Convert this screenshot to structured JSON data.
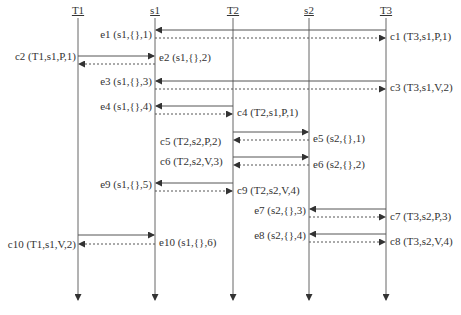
{
  "lifelines": [
    {
      "id": "T1",
      "label": "T1",
      "x": 78
    },
    {
      "id": "s1",
      "label": "s1",
      "x": 155
    },
    {
      "id": "T2",
      "label": "T2",
      "x": 233
    },
    {
      "id": "s2",
      "label": "s2",
      "x": 309
    },
    {
      "id": "T3",
      "label": "T3",
      "x": 386
    }
  ],
  "lifeline_top": 18,
  "lifeline_bottom": 302,
  "messages": [
    {
      "from": "T3",
      "to": "s1",
      "y": 30,
      "style": "solid",
      "label": "c1 (T3,s1,P,1)"
    },
    {
      "from": "s1",
      "to": "T3",
      "y": 38,
      "style": "dotted",
      "label": "e1 (s1,{},1)"
    },
    {
      "from": "T1",
      "to": "s1",
      "y": 56,
      "style": "solid",
      "label": "c2 (T1,s1,P,1)"
    },
    {
      "from": "s1",
      "to": "T1",
      "y": 64,
      "style": "dotted",
      "label": "e2 (s1,{},2)"
    },
    {
      "from": "T3",
      "to": "s1",
      "y": 81,
      "style": "solid",
      "label": "c3 (T3,s1,V,2)"
    },
    {
      "from": "s1",
      "to": "T3",
      "y": 89,
      "style": "dotted",
      "label": "e3 (s1,{},3)"
    },
    {
      "from": "T2",
      "to": "s1",
      "y": 106,
      "style": "solid",
      "label": "c4 (T2,s1,P,1)"
    },
    {
      "from": "s1",
      "to": "T2",
      "y": 114,
      "style": "dotted",
      "label": "e4 (s1,{},4)"
    },
    {
      "from": "T2",
      "to": "s2",
      "y": 132,
      "style": "solid",
      "label": "c5 (T2,s2,P,2)"
    },
    {
      "from": "s2",
      "to": "T2",
      "y": 140,
      "style": "dotted",
      "label": "e5 (s2,{},1)"
    },
    {
      "from": "T2",
      "to": "s2",
      "y": 157,
      "style": "solid",
      "label": "c6 (T2,s2,V,3)"
    },
    {
      "from": "s2",
      "to": "T2",
      "y": 165,
      "style": "dotted",
      "label": "e6 (s2,{},2)"
    },
    {
      "from": "T2",
      "to": "s1",
      "y": 183,
      "style": "solid",
      "label": "c9 (T2,s2,V,4)"
    },
    {
      "from": "s1",
      "to": "T2",
      "y": 191,
      "style": "dotted",
      "label": "e9 (s1,{},5)"
    },
    {
      "from": "T3",
      "to": "s2",
      "y": 209,
      "style": "solid",
      "label": "c7 (T3,s2,P,3)"
    },
    {
      "from": "s2",
      "to": "T3",
      "y": 217,
      "style": "dotted",
      "label": "e7 (s2,{},3)"
    },
    {
      "from": "T3",
      "to": "s2",
      "y": 234,
      "style": "solid",
      "label": "c8 (T3,s2,V,4)"
    },
    {
      "from": "s2",
      "to": "T3",
      "y": 242,
      "style": "dotted",
      "label": "e8 (s2,{},4)"
    },
    {
      "from": "T1",
      "to": "s1",
      "y": 235,
      "style": "solid",
      "label": "c10 (T1,s1,V,2)"
    },
    {
      "from": "s1",
      "to": "T1",
      "y": 244,
      "style": "dotted",
      "label": "e10 (s1,{},6)"
    }
  ],
  "labels": {
    "T1": "T1",
    "s1": "s1",
    "T2": "T2",
    "s2": "s2",
    "T3": "T3",
    "c1": "c1 (T3,s1,P,1)",
    "e1": "e1 (s1,{},1)",
    "c2": "c2 (T1,s1,P,1)",
    "e2": "e2 (s1,{},2)",
    "c3": "c3 (T3,s1,V,2)",
    "e3": "e3 (s1,{},3)",
    "c4": "c4 (T2,s1,P,1)",
    "e4": "e4 (s1,{},4)",
    "c5": "c5 (T2,s2,P,2)",
    "e5": "e5 (s2,{},1)",
    "c6": "c6 (T2,s2,V,3)",
    "e6": "e6 (s2,{},2)",
    "c9": "c9 (T2,s2,V,4)",
    "e9": "e9 (s1,{},5)",
    "c7": "c7 (T3,s2,P,3)",
    "e7": "e7 (s2,{},3)",
    "c8": "c8 (T3,s2,V,4)",
    "e8": "e8 (s2,{},4)",
    "c10": "c10 (T1,s1,V,2)",
    "e10": "e10 (s1,{},6)"
  },
  "colors": {
    "line": "#555555",
    "text": "#333333",
    "background": "#ffffff"
  }
}
